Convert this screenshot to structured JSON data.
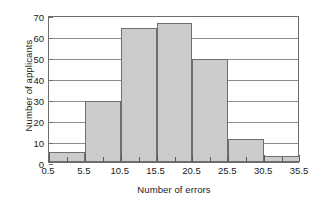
{
  "chart_data": {
    "type": "bar",
    "title": "",
    "subtitle": "",
    "xlabel": "Number of errors",
    "ylabel": "Number of applicants",
    "bin_edges": [
      0.5,
      5.5,
      10.5,
      15.5,
      20.5,
      25.5,
      30.5,
      35.5
    ],
    "bin_width": 5,
    "categories": [
      "0.5-5.5",
      "5.5-10.5",
      "10.5-15.5",
      "15.5-20.5",
      "20.5-25.5",
      "25.5-30.5",
      "30.5-35.5"
    ],
    "values": [
      5,
      29,
      64,
      66,
      49,
      11,
      3
    ],
    "xlim": [
      0.5,
      35.5
    ],
    "ylim": [
      0,
      70
    ],
    "xticks": [
      0.5,
      5.5,
      10.5,
      15.5,
      20.5,
      25.5,
      30.5,
      35.5
    ],
    "xtick_labels": [
      "0.5",
      "5.5",
      "10.5",
      "15.5",
      "20.5",
      "25.5",
      "30.5",
      "35.5"
    ],
    "xminor_ticks": [
      3.0,
      8.0,
      13.0,
      18.0,
      23.0,
      28.0,
      33.0
    ],
    "yticks": [
      0,
      10,
      20,
      30,
      40,
      50,
      60,
      70
    ],
    "ytick_labels": [
      "0",
      "10",
      "20",
      "30",
      "40",
      "50",
      "60",
      "70"
    ],
    "grid": "horizontal",
    "legend": "none",
    "bar_fill_color": "#cccccc",
    "bar_edge_color": "#6e6e6e",
    "gridline_color": "#8d8d8d",
    "axis_color": "#6e6e6e",
    "background_color": "#ffffff"
  }
}
